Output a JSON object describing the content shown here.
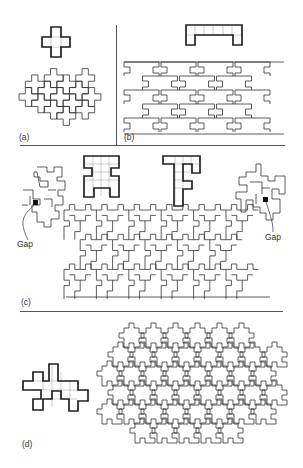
{
  "figure": {
    "panels": [
      {
        "id": "a",
        "label": "(a)",
        "polyomino": "X-pentomino (plus / cross shape, 5 cells)",
        "tiling": "periodic tiling of crosses"
      },
      {
        "id": "b",
        "label": "(b)",
        "polyomino": "staple-shaped heptomino (row of 5 cells with 2 legs)",
        "tiling": "interlocking periodic tiling"
      },
      {
        "id": "c",
        "label": "(c)",
        "polyominoes": [
          "H-shaped polyomino (9 cells)",
          "T/F-shaped polyomino (8 cells)"
        ],
        "tiling": "combined tiling with failed attempts",
        "annotations": [
          "Gap",
          "Gap"
        ]
      },
      {
        "id": "d",
        "label": "(d)",
        "polyomino": "irregular 16-cell polyomino",
        "tiling": "irregular tiling"
      }
    ],
    "annotations": {
      "gap_left": "Gap",
      "gap_right": "Gap"
    },
    "colors": {
      "ink": "#222222",
      "grid": "#999999",
      "background": "#ffffff"
    }
  }
}
